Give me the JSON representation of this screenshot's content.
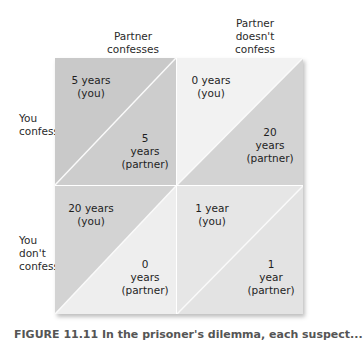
{
  "column_headers": [
    {
      "label_lines": [
        "Partner",
        "confesses"
      ]
    },
    {
      "label_lines": [
        "Partner",
        "doesn't",
        "confess"
      ]
    }
  ],
  "row_headers": [
    {
      "label_lines": [
        "You",
        "confess"
      ]
    },
    {
      "label_lines": [
        "You",
        "don't",
        "confess"
      ]
    }
  ],
  "cells": [
    {
      "you": [
        "5 years",
        "(you)"
      ],
      "partner": [
        "5",
        "years",
        "(partner)"
      ],
      "colors": {
        "upper_left": "#c9c9c9",
        "lower_right": "#cdcdcd"
      }
    },
    {
      "you": [
        "0 years",
        "(you)"
      ],
      "partner": [
        "20",
        "years",
        "(partner)"
      ],
      "colors": {
        "upper_left": "#f2f2f2",
        "lower_right": "#d3d3d3"
      }
    },
    {
      "you": [
        "20 years",
        "(you)"
      ],
      "partner": [
        "0",
        "years",
        "(partner)"
      ],
      "colors": {
        "upper_left": "#d3d3d3",
        "lower_right": "#eeeeee"
      }
    },
    {
      "you": [
        "1 year",
        "(you)"
      ],
      "partner": [
        "1",
        "year",
        "(partner)"
      ],
      "colors": {
        "upper_left": "#e6e6e6",
        "lower_right": "#e3e3e3"
      }
    }
  ],
  "divider_color": "#fafafa",
  "caption": "FIGURE 11.11 In the prisoner's dilemma, each suspect..."
}
